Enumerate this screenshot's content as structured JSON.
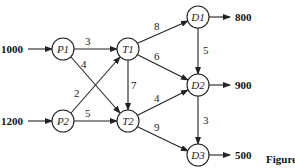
{
  "nodes": {
    "P1": {
      "label": "P1"
    },
    "P2": {
      "label": "P2"
    },
    "T1": {
      "label": "T1"
    },
    "T2": {
      "label": "T2"
    },
    "D1": {
      "label": "D1"
    },
    "D2": {
      "label": "D2"
    },
    "D3": {
      "label": "D3"
    }
  },
  "supplies": {
    "P1": "1000",
    "P2": "1200"
  },
  "demands": {
    "D1": "800",
    "D2": "900",
    "D3": "500"
  },
  "edges": {
    "P1_T1": "3",
    "P1_T2": "4",
    "P2_T1": "2",
    "P2_T2": "5",
    "T1_T2": "7",
    "T1_D1": "8",
    "T1_D2": "6",
    "T2_D2": "4",
    "T2_D3": "9",
    "D1_D2": "5",
    "D2_D3": "3"
  },
  "caption": "Figure"
}
